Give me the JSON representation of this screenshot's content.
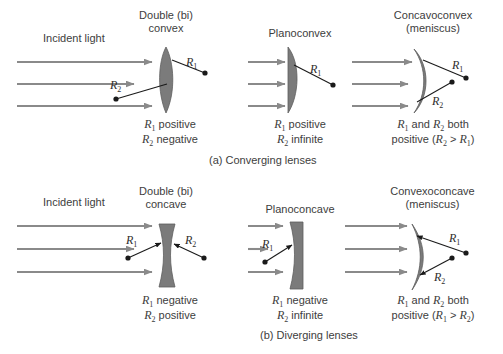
{
  "figure": {
    "incident_light_label": "Incident light",
    "lens_fill_color": "#7b7b7b",
    "arrow_color": "#8a8a8a",
    "text_color": "#3d3d3d",
    "line_color": "#1a1a1a"
  },
  "panels": {
    "a": {
      "caption": "(a)  Converging lenses",
      "lenses": [
        {
          "title_line1": "Double (bi)",
          "title_line2": "convex",
          "shape": "biconvex",
          "note_line1_pre": "",
          "note_line1_r": "R",
          "note_line1_sub": "1",
          "note_line1_post": " positive",
          "note_line2_r": "R",
          "note_line2_sub": "2",
          "note_line2_post": " negative",
          "radius_labels": [
            "R1",
            "R2"
          ]
        },
        {
          "title_line1": "Planoconvex",
          "title_line2": "",
          "shape": "planoconvex",
          "note_line1_r": "R",
          "note_line1_sub": "1",
          "note_line1_post": " positive",
          "note_line2_r": "R",
          "note_line2_sub": "2",
          "note_line2_post": " infinite",
          "radius_labels": [
            "R1"
          ]
        },
        {
          "title_line1": "Concavoconvex",
          "title_line2": "(meniscus)",
          "shape": "concavoconvex",
          "note_line1_full": "R1 and R2 both",
          "note_line2_full": "positive (R2 > R1)",
          "radius_labels": [
            "R1",
            "R2"
          ]
        }
      ]
    },
    "b": {
      "caption": "(b)  Diverging lenses",
      "lenses": [
        {
          "title_line1": "Double (bi)",
          "title_line2": "concave",
          "shape": "biconcave",
          "note_line1_r": "R",
          "note_line1_sub": "1",
          "note_line1_post": " negative",
          "note_line2_r": "R",
          "note_line2_sub": "2",
          "note_line2_post": " positive",
          "radius_labels": [
            "R1",
            "R2"
          ]
        },
        {
          "title_line1": "Planoconcave",
          "title_line2": "",
          "shape": "planoconcave",
          "note_line1_r": "R",
          "note_line1_sub": "1",
          "note_line1_post": " negative",
          "note_line2_r": "R",
          "note_line2_sub": "2",
          "note_line2_post": " infinite",
          "radius_labels": [
            "R1"
          ]
        },
        {
          "title_line1": "Convexoconcave",
          "title_line2": "(meniscus)",
          "shape": "convexoconcave",
          "note_line1_full": "R1 and R2 both",
          "note_line2_full": "positive (R1 > R2)",
          "radius_labels": [
            "R1",
            "R2"
          ]
        }
      ]
    }
  },
  "labels": {
    "R": "R",
    "sub1": "1",
    "sub2": "2",
    "and": " and ",
    "both": " both",
    "positive_open": "positive (",
    "gt": " > ",
    "close": ")"
  }
}
